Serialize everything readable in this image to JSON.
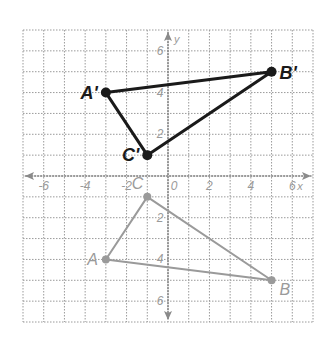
{
  "diagram": {
    "type": "coordinate-plane-reflection",
    "grid": {
      "xmin": -7,
      "xmax": 7,
      "ymin": -7,
      "ymax": 7,
      "step": 1
    },
    "axes": {
      "x_label": "x",
      "y_label": "y",
      "x_ticks": [
        {
          "value": -6,
          "label": "-6"
        },
        {
          "value": -4,
          "label": "-4"
        },
        {
          "value": -2,
          "label": "-2"
        },
        {
          "value": 0,
          "label": "0"
        },
        {
          "value": 2,
          "label": "2"
        },
        {
          "value": 4,
          "label": "4"
        },
        {
          "value": 6,
          "label": "6"
        }
      ],
      "y_ticks": [
        {
          "value": 6,
          "label": "6"
        },
        {
          "value": 4,
          "label": "4"
        },
        {
          "value": 2,
          "label": "2"
        },
        {
          "value": -2,
          "label": "2"
        },
        {
          "value": -4,
          "label": "4"
        },
        {
          "value": -6,
          "label": "6"
        }
      ]
    },
    "image_triangle": {
      "color": "#1a1a1a",
      "vertices": [
        {
          "name": "A'",
          "x": -3,
          "y": 4
        },
        {
          "name": "B'",
          "x": 5,
          "y": 5
        },
        {
          "name": "C'",
          "x": -1,
          "y": 1
        }
      ]
    },
    "preimage_triangle": {
      "color": "#9a9a9a",
      "vertices": [
        {
          "name": "A",
          "x": -3,
          "y": -4
        },
        {
          "name": "B",
          "x": 5,
          "y": -5
        },
        {
          "name": "C",
          "x": -1,
          "y": -1
        }
      ]
    },
    "colors": {
      "grid": "#9a9a9a",
      "axis": "#8a8a8a",
      "tick_label": "#9a9a9a",
      "image": "#1a1a1a",
      "preimage": "#9a9a9a"
    }
  }
}
